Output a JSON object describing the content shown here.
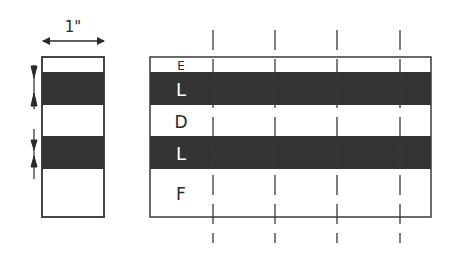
{
  "diagram": {
    "width_label": "1\"",
    "colors": {
      "stroke": "#3a3a3a",
      "dark_band": "#333333",
      "light_band": "#ffffff",
      "dark_text": "#ffffff",
      "light_text": "#2a2a2a"
    },
    "left_strip": {
      "bands": [
        "light",
        "dark",
        "light",
        "dark",
        "light"
      ]
    },
    "right_block": {
      "rows": [
        {
          "label": "E",
          "tone": "light"
        },
        {
          "label": "L",
          "tone": "dark"
        },
        {
          "label": "D",
          "tone": "light"
        },
        {
          "label": "L",
          "tone": "dark"
        },
        {
          "label": "F",
          "tone": "light"
        }
      ],
      "cut_lines": 4
    }
  }
}
